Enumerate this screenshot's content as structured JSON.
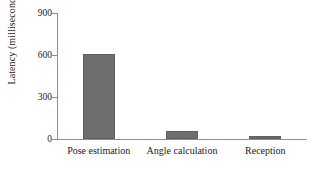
{
  "chart_data": {
    "type": "bar",
    "title": "",
    "xlabel": "",
    "ylabel": "Latency (milliseconds)",
    "categories": [
      "Pose estimation",
      "Angle calculation",
      "Reception"
    ],
    "values": [
      610,
      60,
      20
    ],
    "ylim": [
      0,
      900
    ],
    "yticks": [
      0,
      300,
      600,
      900
    ],
    "ytick_labels": [
      "0",
      "300",
      "600",
      "900"
    ],
    "grid": false,
    "legend": null,
    "series": [
      {
        "name": "Latency",
        "values": [
          610,
          60,
          20
        ],
        "color": "#6e6e6e"
      }
    ],
    "colors": {
      "bar_fill": "#6e6e6e",
      "bar_edge": "#5e5e5e",
      "axis_line": "#8f8f8f",
      "text": "#1c1c1c",
      "background": "#ffffff"
    }
  }
}
